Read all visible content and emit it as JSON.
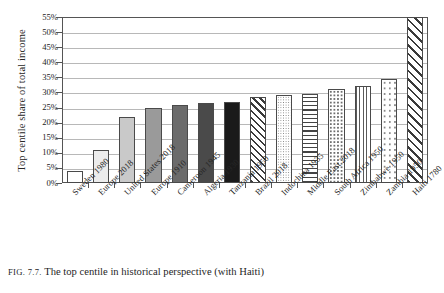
{
  "figure": {
    "caption_prefix": "FIG. 7.7.",
    "caption_text": "The top centile in historical perspective (with Haiti)"
  },
  "chart_data": {
    "type": "bar",
    "title": "",
    "xlabel": "",
    "ylabel": "Top centile share of total income",
    "ylim": [
      0,
      55
    ],
    "ytick_step": 5,
    "grid": true,
    "legend": "none",
    "ytick_labels": [
      "0%",
      "5%",
      "10%",
      "15%",
      "20%",
      "25%",
      "30%",
      "35%",
      "40%",
      "45%",
      "50%",
      "55%"
    ],
    "categories": [
      "Sweden 1980",
      "Europe 2018",
      "United States 2018",
      "Europe 1910",
      "Cameroon 1945",
      "Algeria 1930",
      "Tanzania 1950",
      "Brazil 2018",
      "Indochina 1935",
      "Middle East 2018",
      "South Africa 1950",
      "Zimbabwe 1950",
      "Zambia 1950",
      "Haiti 1780"
    ],
    "values": [
      4,
      11,
      22,
      25,
      26,
      26.5,
      27,
      28.5,
      29,
      29.5,
      31,
      32,
      34.5,
      55
    ],
    "bar_styles": [
      "white-solid",
      "very-light-gray-solid",
      "light-gray-solid",
      "medium-gray-solid",
      "dark-gray-solid",
      "darker-gray-solid",
      "near-black-solid",
      "diagonal-hatch",
      "fine-dots",
      "horizontal-lines",
      "dots",
      "vertical-lines",
      "sparse-dots",
      "diagonal-hatch-wide"
    ],
    "bar_colors": [
      "#ffffff",
      "#ececec",
      "#c9c9c9",
      "#9a9a9a",
      "#6b6b6b",
      "#4a4a4a",
      "#1a1a1a",
      "#ffffff",
      "#ffffff",
      "#ffffff",
      "#ffffff",
      "#ffffff",
      "#ffffff",
      "#ffffff"
    ]
  }
}
